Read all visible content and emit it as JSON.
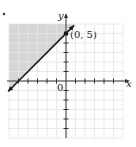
{
  "chart_data": {
    "type": "line",
    "title": "",
    "xlabel": "x",
    "ylabel": "y",
    "xlim": [
      -6,
      6
    ],
    "ylim": [
      -6,
      6
    ],
    "grid": true,
    "tick_step": 1,
    "origin_label": "0",
    "inequality": "y >= x + 5",
    "boundary_line": {
      "slope": 1,
      "intercept": 5,
      "style": "solid",
      "points": [
        [
          -5,
          0
        ],
        [
          0,
          5
        ]
      ]
    },
    "shaded_region": "above-left of line (upper-left)",
    "shade_color": "#d6d6d6",
    "labeled_points": [
      {
        "x": 0,
        "y": 5,
        "label": "(0, 5)"
      }
    ]
  },
  "colors": {
    "grid": "#e4e4e4",
    "axis": "#333333",
    "line": "#1a1a1a",
    "shade": "#d6d6d6"
  }
}
